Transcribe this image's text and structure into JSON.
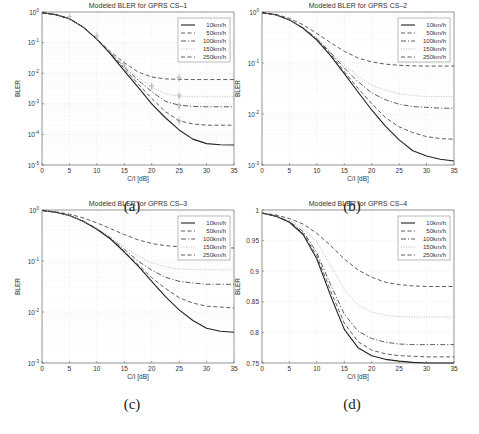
{
  "figure": {
    "captions": [
      "(a)",
      "(b)",
      "(c)",
      "(d)"
    ],
    "legend_labels": [
      "10km/h",
      "50km/h",
      "100km/h",
      "150km/h",
      "250km/h"
    ]
  },
  "chart_data": [
    {
      "id": "a",
      "type": "line",
      "title": "Modeled BLER for GPRS CS–1",
      "xlabel": "C/I [dB]",
      "ylabel": "BLER",
      "yscale": "log",
      "xlim": [
        0,
        35
      ],
      "ylim": [
        1e-05,
        1
      ],
      "xticks": [
        0,
        5,
        10,
        15,
        20,
        25,
        30,
        35
      ],
      "yticks": [
        "10^0",
        "10^-1",
        "10^-2",
        "10^-3",
        "10^-4",
        "10^-5"
      ],
      "grid": true,
      "legend_position": "upper right",
      "x": [
        0,
        2.5,
        5,
        7.5,
        10,
        12.5,
        15,
        17.5,
        20,
        22.5,
        25,
        27.5,
        30,
        32.5,
        35
      ],
      "series": [
        {
          "name": "10km/h",
          "style": "solid",
          "values": [
            0.95,
            0.82,
            0.6,
            0.32,
            0.13,
            0.042,
            0.012,
            0.0035,
            0.001,
            0.00035,
            0.00014,
            7e-05,
            5e-05,
            4.6e-05,
            4.5e-05
          ]
        },
        {
          "name": "50km/h",
          "style": "dashed",
          "values": [
            0.95,
            0.82,
            0.6,
            0.32,
            0.13,
            0.044,
            0.014,
            0.0045,
            0.0015,
            0.00055,
            0.00028,
            0.00022,
            0.0002,
            0.0002,
            0.0002
          ]
        },
        {
          "name": "100km/h",
          "style": "dashdot",
          "values": [
            0.95,
            0.82,
            0.6,
            0.32,
            0.13,
            0.045,
            0.016,
            0.006,
            0.0025,
            0.0012,
            0.0009,
            0.00082,
            0.0008,
            0.0008,
            0.0008
          ]
        },
        {
          "name": "150km/h",
          "style": "dotted",
          "values": [
            0.95,
            0.82,
            0.6,
            0.32,
            0.13,
            0.046,
            0.018,
            0.0075,
            0.0035,
            0.0021,
            0.0018,
            0.0017,
            0.0017,
            0.0017,
            0.0017
          ]
        },
        {
          "name": "250km/h",
          "style": "dashed",
          "values": [
            0.95,
            0.82,
            0.6,
            0.32,
            0.13,
            0.05,
            0.022,
            0.011,
            0.0075,
            0.0065,
            0.0063,
            0.0062,
            0.0062,
            0.0062,
            0.0062
          ]
        }
      ],
      "markers": [
        {
          "x": 5,
          "y": 0.62
        },
        {
          "x": 10,
          "y": 0.15
        },
        {
          "x": 15,
          "y": 0.018
        },
        {
          "x": 20,
          "y": 0.0035
        },
        {
          "x": 25,
          "y": 0.0065
        },
        {
          "x": 25,
          "y": 0.0017
        },
        {
          "x": 25,
          "y": 0.0008
        },
        {
          "x": 25,
          "y": 0.00025
        }
      ]
    },
    {
      "id": "b",
      "type": "line",
      "title": "Modeled BLER for GPRS CS–2",
      "xlabel": "C/I [dB]",
      "ylabel": "BLER",
      "yscale": "log",
      "xlim": [
        0,
        35
      ],
      "ylim": [
        0.001,
        1
      ],
      "xticks": [
        0,
        5,
        10,
        15,
        20,
        25,
        30,
        35
      ],
      "yticks": [
        "10^0",
        "10^-1",
        "10^-2",
        "10^-3"
      ],
      "grid": true,
      "legend_position": "upper right",
      "x": [
        0,
        2.5,
        5,
        7.5,
        10,
        12.5,
        15,
        17.5,
        20,
        22.5,
        25,
        27.5,
        30,
        32.5,
        35
      ],
      "series": [
        {
          "name": "10km/h",
          "style": "solid",
          "values": [
            0.97,
            0.88,
            0.7,
            0.48,
            0.28,
            0.14,
            0.062,
            0.027,
            0.012,
            0.0058,
            0.0031,
            0.0019,
            0.0015,
            0.0013,
            0.0012
          ]
        },
        {
          "name": "50km/h",
          "style": "dashed",
          "values": [
            0.97,
            0.88,
            0.7,
            0.48,
            0.29,
            0.15,
            0.068,
            0.032,
            0.016,
            0.0085,
            0.0056,
            0.0043,
            0.0036,
            0.0033,
            0.0032
          ]
        },
        {
          "name": "100km/h",
          "style": "dashdot",
          "values": [
            0.97,
            0.88,
            0.7,
            0.49,
            0.3,
            0.16,
            0.08,
            0.043,
            0.026,
            0.019,
            0.0155,
            0.014,
            0.0135,
            0.013,
            0.013
          ]
        },
        {
          "name": "150km/h",
          "style": "dotted",
          "values": [
            0.97,
            0.88,
            0.71,
            0.5,
            0.31,
            0.17,
            0.092,
            0.055,
            0.037,
            0.029,
            0.025,
            0.023,
            0.022,
            0.022,
            0.022
          ]
        },
        {
          "name": "250km/h",
          "style": "dashed",
          "values": [
            0.97,
            0.9,
            0.75,
            0.56,
            0.38,
            0.25,
            0.17,
            0.125,
            0.105,
            0.095,
            0.09,
            0.088,
            0.087,
            0.087,
            0.087
          ]
        }
      ]
    },
    {
      "id": "c",
      "type": "line",
      "title": "Modeled BLER for GPRS CS–3",
      "xlabel": "C/I [dB]",
      "ylabel": "BLER",
      "yscale": "log",
      "xlim": [
        0,
        35
      ],
      "ylim": [
        0.001,
        1
      ],
      "xticks": [
        0,
        5,
        10,
        15,
        20,
        25,
        30,
        35
      ],
      "yticks": [
        "10^0",
        "10^-1",
        "10^-2",
        "10^-3"
      ],
      "grid": true,
      "legend_position": "upper right",
      "x": [
        0,
        2.5,
        5,
        7.5,
        10,
        12.5,
        15,
        17.5,
        20,
        22.5,
        25,
        27.5,
        30,
        32.5,
        35
      ],
      "series": [
        {
          "name": "10km/h",
          "style": "solid",
          "values": [
            0.98,
            0.9,
            0.78,
            0.6,
            0.42,
            0.27,
            0.15,
            0.08,
            0.04,
            0.02,
            0.011,
            0.0068,
            0.0048,
            0.0042,
            0.004
          ]
        },
        {
          "name": "50km/h",
          "style": "dashed",
          "values": [
            0.98,
            0.9,
            0.78,
            0.6,
            0.42,
            0.27,
            0.155,
            0.085,
            0.047,
            0.029,
            0.019,
            0.015,
            0.013,
            0.0125,
            0.012
          ]
        },
        {
          "name": "100km/h",
          "style": "dashdot",
          "values": [
            0.98,
            0.9,
            0.78,
            0.61,
            0.43,
            0.28,
            0.17,
            0.1,
            0.066,
            0.048,
            0.04,
            0.037,
            0.035,
            0.035,
            0.035
          ]
        },
        {
          "name": "150km/h",
          "style": "dotted",
          "values": [
            0.98,
            0.9,
            0.78,
            0.61,
            0.44,
            0.3,
            0.19,
            0.125,
            0.092,
            0.077,
            0.07,
            0.068,
            0.067,
            0.067,
            0.067
          ]
        },
        {
          "name": "250km/h",
          "style": "dashed",
          "values": [
            0.98,
            0.92,
            0.83,
            0.7,
            0.56,
            0.43,
            0.33,
            0.26,
            0.22,
            0.2,
            0.19,
            0.185,
            0.18,
            0.18,
            0.18
          ]
        }
      ]
    },
    {
      "id": "d",
      "type": "line",
      "title": "Modeled BLER for GPRS CS–4",
      "xlabel": "C/I [dB]",
      "ylabel": "BLER",
      "yscale": "linear",
      "xlim": [
        0,
        35
      ],
      "ylim": [
        0.75,
        1
      ],
      "xticks": [
        0,
        5,
        10,
        15,
        20,
        25,
        30,
        35
      ],
      "yticks": [
        "1",
        "0.95",
        "0.9",
        "0.85",
        "0.8",
        "0.75"
      ],
      "grid": true,
      "legend_position": "upper right",
      "x": [
        0,
        2.5,
        5,
        7.5,
        10,
        12.5,
        15,
        17.5,
        20,
        22.5,
        25,
        27.5,
        30,
        32.5,
        35
      ],
      "series": [
        {
          "name": "10km/h",
          "style": "solid",
          "values": [
            0.995,
            0.99,
            0.98,
            0.96,
            0.92,
            0.86,
            0.805,
            0.775,
            0.762,
            0.756,
            0.753,
            0.751,
            0.75,
            0.75,
            0.75
          ]
        },
        {
          "name": "50km/h",
          "style": "dashed",
          "values": [
            0.995,
            0.99,
            0.98,
            0.962,
            0.925,
            0.868,
            0.815,
            0.785,
            0.771,
            0.765,
            0.762,
            0.761,
            0.76,
            0.76,
            0.76
          ]
        },
        {
          "name": "100km/h",
          "style": "dashdot",
          "values": [
            0.995,
            0.99,
            0.981,
            0.965,
            0.93,
            0.878,
            0.83,
            0.802,
            0.79,
            0.784,
            0.781,
            0.78,
            0.78,
            0.78,
            0.78
          ]
        },
        {
          "name": "150km/h",
          "style": "dotted",
          "values": [
            0.995,
            0.991,
            0.983,
            0.97,
            0.948,
            0.91,
            0.87,
            0.845,
            0.833,
            0.828,
            0.826,
            0.825,
            0.825,
            0.825,
            0.825
          ]
        },
        {
          "name": "250km/h",
          "style": "dashed",
          "values": [
            0.995,
            0.992,
            0.986,
            0.977,
            0.962,
            0.942,
            0.92,
            0.902,
            0.89,
            0.882,
            0.878,
            0.876,
            0.875,
            0.875,
            0.875
          ]
        }
      ]
    }
  ]
}
